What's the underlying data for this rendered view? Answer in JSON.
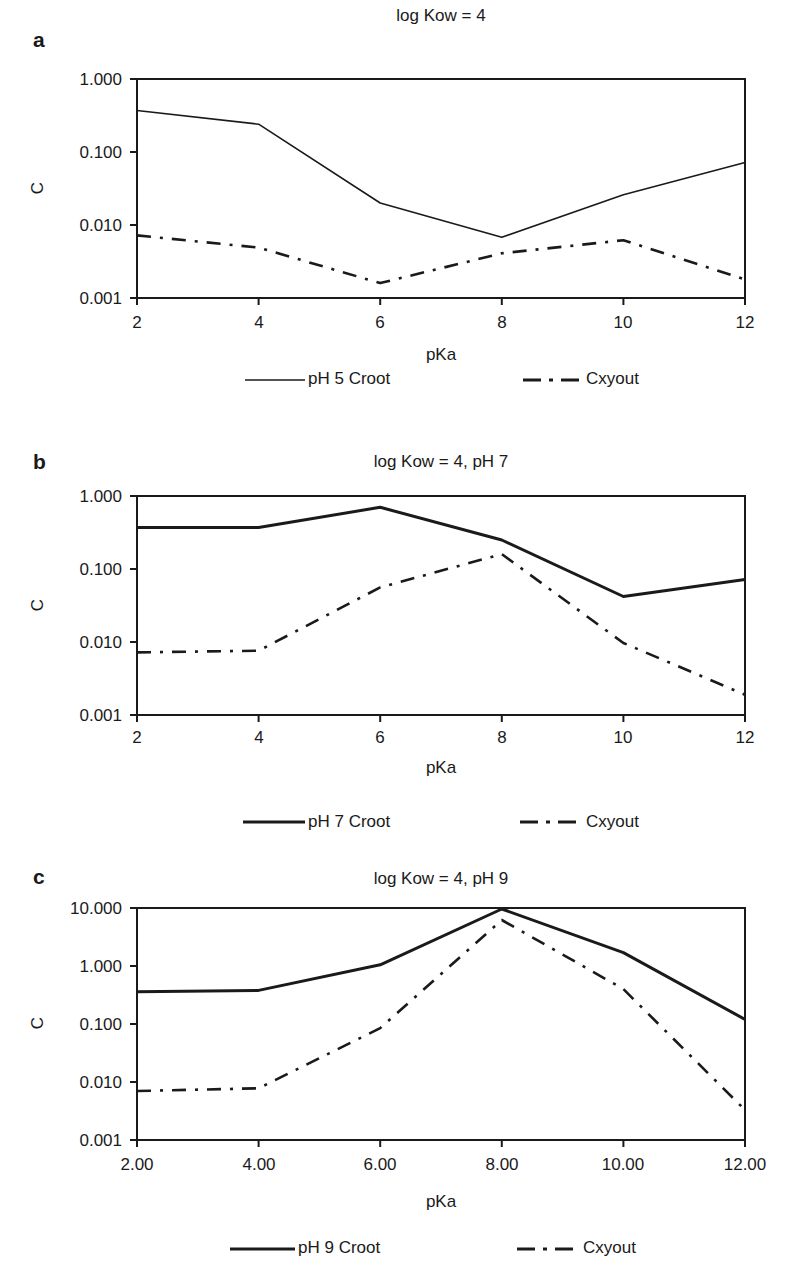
{
  "chart_data": [
    {
      "type": "line",
      "panel": "a",
      "title": "log Kow = 4",
      "xlabel": "pKa",
      "ylabel": "C",
      "yscale": "log",
      "ylim": [
        0.001,
        1.0
      ],
      "xlim": [
        2,
        12
      ],
      "x_tick_labels": [
        "2",
        "4",
        "6",
        "8",
        "10",
        "12"
      ],
      "y_tick_labels": [
        "1.000",
        "0.100",
        "0.010",
        "0.001"
      ],
      "x": [
        2,
        4,
        6,
        8,
        10,
        12
      ],
      "series": [
        {
          "name": "pH 5  Croot",
          "style": "solid-thin",
          "values": [
            0.37,
            0.24,
            0.02,
            0.0068,
            0.026,
            0.072
          ]
        },
        {
          "name": "Cxyout",
          "style": "dash-dot",
          "values": [
            0.0072,
            0.0049,
            0.0016,
            0.0041,
            0.0062,
            0.0018
          ]
        }
      ],
      "legend_position": "bottom",
      "grid": false
    },
    {
      "type": "line",
      "panel": "b",
      "title": "log Kow = 4, pH 7",
      "xlabel": "pKa",
      "ylabel": "C",
      "yscale": "log",
      "ylim": [
        0.001,
        1.0
      ],
      "xlim": [
        2,
        12
      ],
      "x_tick_labels": [
        "2",
        "4",
        "6",
        "8",
        "10",
        "12"
      ],
      "y_tick_labels": [
        "1.000",
        "0.100",
        "0.010",
        "0.001"
      ],
      "x": [
        2,
        4,
        6,
        8,
        10,
        12
      ],
      "series": [
        {
          "name": "pH 7  Croot",
          "style": "solid-thick",
          "values": [
            0.37,
            0.37,
            0.7,
            0.25,
            0.042,
            0.072
          ]
        },
        {
          "name": "Cxyout",
          "style": "dash-dot",
          "values": [
            0.0072,
            0.0076,
            0.056,
            0.16,
            0.0097,
            0.0019
          ]
        }
      ],
      "legend_position": "bottom",
      "grid": false
    },
    {
      "type": "line",
      "panel": "c",
      "title": "log Kow = 4, pH 9",
      "xlabel": "pKa",
      "ylabel": "C",
      "yscale": "log",
      "ylim": [
        0.001,
        10.0
      ],
      "xlim": [
        2,
        12
      ],
      "x_tick_labels": [
        "2.00",
        "4.00",
        "6.00",
        "8.00",
        "10.00",
        "12.00"
      ],
      "y_tick_labels": [
        "10.000",
        "1.000",
        "0.100",
        "0.010",
        "0.001"
      ],
      "x": [
        2,
        4,
        6,
        8,
        10,
        12
      ],
      "series": [
        {
          "name": "pH 9  Croot",
          "style": "solid-thick",
          "values": [
            0.36,
            0.38,
            1.05,
            9.6,
            1.7,
            0.12
          ]
        },
        {
          "name": "Cxyout",
          "style": "dash-dot",
          "values": [
            0.007,
            0.0078,
            0.085,
            6.2,
            0.4,
            0.0033
          ]
        }
      ],
      "legend_position": "bottom",
      "grid": false
    }
  ],
  "panels": [
    {
      "letter": "a",
      "title": "log Kow = 4",
      "ylabel": "C",
      "xlabel": "pKa",
      "yticks": [
        "1.000",
        "0.100",
        "0.010",
        "0.001"
      ],
      "xticks": [
        "2",
        "4",
        "6",
        "8",
        "10",
        "12"
      ],
      "legend": [
        "pH 5  Croot",
        "Cxyout"
      ]
    },
    {
      "letter": "b",
      "title": "log Kow = 4, pH 7",
      "ylabel": "C",
      "xlabel": "pKa",
      "yticks": [
        "1.000",
        "0.100",
        "0.010",
        "0.001"
      ],
      "xticks": [
        "2",
        "4",
        "6",
        "8",
        "10",
        "12"
      ],
      "legend": [
        "pH 7  Croot",
        "Cxyout"
      ]
    },
    {
      "letter": "c",
      "title": "log Kow = 4, pH 9",
      "ylabel": "C",
      "xlabel": "pKa",
      "yticks": [
        "10.000",
        "1.000",
        "0.100",
        "0.010",
        "0.001"
      ],
      "xticks": [
        "2.00",
        "4.00",
        "6.00",
        "8.00",
        "10.00",
        "12.00"
      ],
      "legend": [
        "pH 9  Croot",
        "Cxyout"
      ]
    }
  ],
  "colors": {
    "line": "#1a1a1a",
    "background": "#ffffff"
  }
}
